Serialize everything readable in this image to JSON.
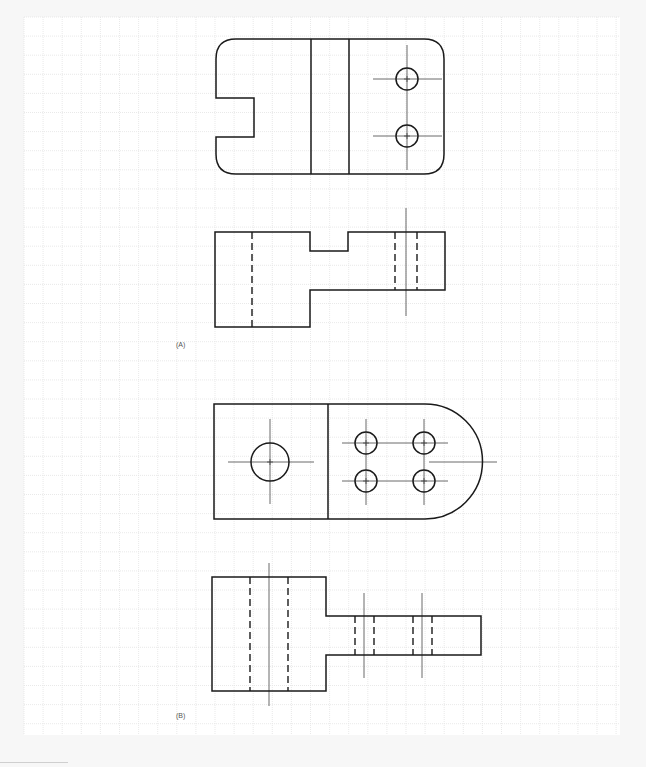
{
  "figure": {
    "labels": [
      {
        "id": "A",
        "text": "(A)",
        "x": 176,
        "y": 341
      },
      {
        "id": "B",
        "text": "(B)",
        "x": 176,
        "y": 712
      }
    ],
    "colors": {
      "line": "#1a1a1a",
      "grid": "#e3e3e3",
      "center": "#444444",
      "paper": "#ffffff"
    },
    "grid": {
      "x0": 24,
      "y0": 17,
      "x1": 620,
      "y1": 735,
      "step": 19.1
    }
  },
  "views": {
    "A_top": {
      "outline": "M 236 39 L 424 39 Q 444 39 444 59 L 444 154 Q 444 174 424 174 L 236 174 Q 216 174 216 154 L 216 137 L 254 137 L 254 98 L 216 98 L 216 59 Q 216 39 236 39 Z",
      "lines": [
        [
          311,
          39,
          311,
          174
        ],
        [
          349,
          39,
          349,
          174
        ]
      ],
      "circles": [
        {
          "cx": 407,
          "cy": 79,
          "r": 11
        },
        {
          "cx": 407,
          "cy": 136,
          "r": 11
        }
      ],
      "centerlines": [
        [
          373,
          79,
          442,
          79
        ],
        [
          373,
          136,
          442,
          136
        ],
        [
          407,
          45,
          407,
          170
        ]
      ]
    },
    "A_front": {
      "outline": "M 215 232 L 310 232 L 310 251 L 348 251 L 348 232 L 445 232 L 445 290 L 310 290 L 310 327 L 215 327 Z",
      "lines": [],
      "hidden": [
        [
          252,
          232,
          252,
          327
        ],
        [
          395,
          232,
          395,
          290
        ],
        [
          417,
          232,
          417,
          290
        ]
      ],
      "centerlines": [
        [
          406,
          208,
          406,
          316
        ]
      ]
    },
    "B_top": {
      "outline": "M 214 404 L 425 404 A 57 57 0 0 1 425 519 L 214 519 Z",
      "lines": [
        [
          328,
          404,
          328,
          519
        ]
      ],
      "circles": [
        {
          "cx": 270,
          "cy": 462,
          "r": 19
        },
        {
          "cx": 366,
          "cy": 443,
          "r": 11
        },
        {
          "cx": 424,
          "cy": 443,
          "r": 11
        },
        {
          "cx": 366,
          "cy": 481,
          "r": 11
        },
        {
          "cx": 424,
          "cy": 481,
          "r": 11
        }
      ],
      "centerlines": [
        [
          228,
          462,
          314,
          462
        ],
        [
          270,
          419,
          270,
          504
        ],
        [
          342,
          443,
          448,
          443
        ],
        [
          342,
          481,
          448,
          481
        ],
        [
          366,
          419,
          366,
          505
        ],
        [
          424,
          419,
          424,
          505
        ],
        [
          429,
          462,
          497,
          462
        ]
      ]
    },
    "B_front": {
      "outline": "M 212 577 L 326 577 L 326 616 L 481 616 L 481 655 L 326 655 L 326 691 L 212 691 Z",
      "lines": [],
      "hidden": [
        [
          250,
          577,
          250,
          691
        ],
        [
          288,
          577,
          288,
          691
        ],
        [
          355,
          616,
          355,
          655
        ],
        [
          374,
          616,
          374,
          655
        ],
        [
          413,
          616,
          413,
          655
        ],
        [
          432,
          616,
          432,
          655
        ]
      ],
      "centerlines": [
        [
          269,
          563,
          269,
          706
        ],
        [
          364,
          593,
          364,
          678
        ],
        [
          422,
          593,
          422,
          678
        ]
      ]
    }
  }
}
